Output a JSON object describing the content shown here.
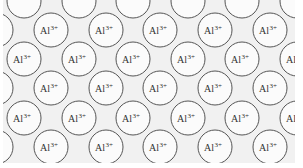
{
  "diagram": {
    "title": "",
    "ion_label": "Al",
    "ion_charge": "3+",
    "colors": {
      "background": "#f1f1f1",
      "circle_fill": "#fbfbfb",
      "circle_stroke": "#555555",
      "text": "#333333",
      "margin": "#ffffff"
    },
    "region": {
      "x": 3,
      "y": 0,
      "width": 292,
      "height": 163
    },
    "circle_radius": 17,
    "rows": [
      {
        "y": 1,
        "label": false,
        "xs": [
          24,
          79,
          133,
          188,
          242,
          297
        ]
      },
      {
        "y": 30,
        "label": true,
        "xs": [
          -4,
          51,
          106,
          160,
          215,
          270
        ]
      },
      {
        "y": 59,
        "label": true,
        "xs": [
          24,
          79,
          133,
          188,
          242,
          297
        ]
      },
      {
        "y": 88,
        "label": true,
        "xs": [
          -4,
          51,
          106,
          160,
          215,
          270
        ]
      },
      {
        "y": 118,
        "label": true,
        "xs": [
          24,
          79,
          133,
          188,
          242,
          297
        ]
      },
      {
        "y": 147,
        "label": true,
        "xs": [
          -4,
          51,
          106,
          160,
          215,
          270
        ]
      }
    ]
  }
}
